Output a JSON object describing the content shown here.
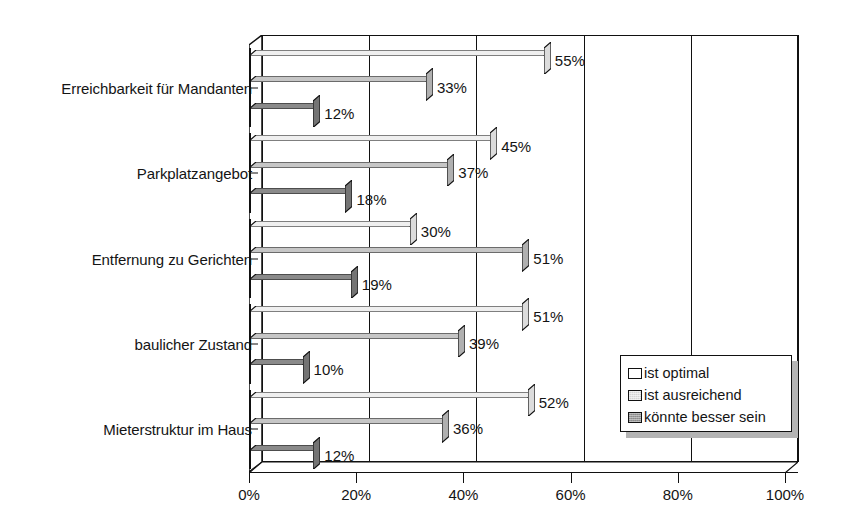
{
  "chart_data": {
    "type": "bar",
    "orientation": "horizontal",
    "grouped": true,
    "title": "",
    "subtitle": "",
    "xlabel": "",
    "ylabel": "",
    "categories": [
      "Erreichbarkeit für Mandanten",
      "Parkplatzangebot",
      "Entfernung zu Gerichten",
      "baulicher Zustand",
      "Mieterstruktur im Haus"
    ],
    "series": [
      {
        "name": "ist optimal",
        "color": "#ffffff",
        "values": [
          55,
          45,
          30,
          51,
          52
        ],
        "labels": [
          "55%",
          "45%",
          "30%",
          "51%",
          "52%"
        ]
      },
      {
        "name": "ist ausreichend",
        "color": "#d4d4d4",
        "values": [
          33,
          37,
          51,
          39,
          36
        ],
        "labels": [
          "33%",
          "37%",
          "51%",
          "39%",
          "36%"
        ]
      },
      {
        "name": "könnte besser sein",
        "color": "#9a9a9a",
        "values": [
          12,
          18,
          19,
          10,
          12
        ],
        "labels": [
          "12%",
          "18%",
          "19%",
          "10%",
          "12%"
        ]
      }
    ],
    "xlim": [
      0,
      100
    ],
    "xticks": [
      0,
      20,
      40,
      60,
      80,
      100
    ],
    "xtick_labels": [
      "0%",
      "20%",
      "40%",
      "60%",
      "80%",
      "100%"
    ],
    "grid": true,
    "grid_axis": "x",
    "legend_position": "bottom-right",
    "style_3d": true
  },
  "legend": {
    "items": [
      {
        "label": "ist optimal"
      },
      {
        "label": "ist ausreichend"
      },
      {
        "label": "könnte besser sein"
      }
    ]
  }
}
